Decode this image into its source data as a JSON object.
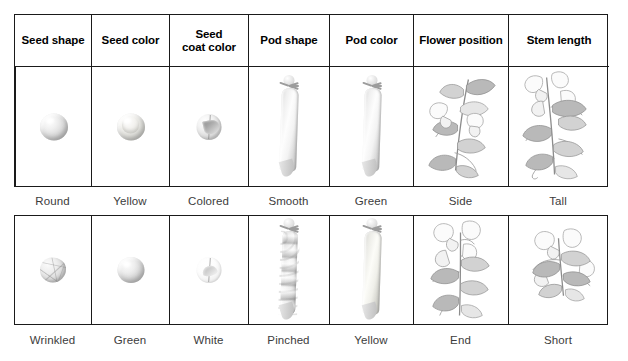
{
  "table": {
    "headers": [
      "Seed shape",
      "Seed color",
      "Seed\ncoat color",
      "Pod shape",
      "Pod color",
      "Flower position",
      "Stem length"
    ],
    "rows": [
      {
        "name": "dominant-traits-row",
        "captions": [
          "Round",
          "Yellow",
          "Colored",
          "Smooth",
          "Green",
          "Side",
          "Tall"
        ],
        "images": [
          "round-seed-illustration",
          "yellow-seed-illustration",
          "colored-seed-coat-illustration",
          "smooth-pod-illustration",
          "green-pod-illustration",
          "side-flower-position-plant-illustration",
          "tall-stem-plant-illustration"
        ]
      },
      {
        "name": "recessive-traits-row",
        "captions": [
          "Wrinkled",
          "Green",
          "White",
          "Pinched",
          "Yellow",
          "End",
          "Short"
        ],
        "images": [
          "wrinkled-seed-illustration",
          "green-seed-illustration",
          "white-seed-coat-illustration",
          "pinched-pod-illustration",
          "yellow-pod-illustration",
          "end-flower-position-plant-illustration",
          "short-stem-plant-illustration"
        ]
      }
    ]
  },
  "colors": {
    "border": "#1a1a1a",
    "header_text": "#000000",
    "caption_text": "#3c3c3c",
    "background": "#ffffff"
  }
}
